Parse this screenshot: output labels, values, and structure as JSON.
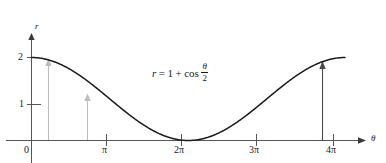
{
  "figure": {
    "kind": "math-plot",
    "equation": {
      "lhs": "r",
      "equals": "=",
      "term1": "1",
      "plus": "+",
      "func": "cos",
      "numerator": "θ",
      "denominator": "2",
      "full_text": "r = 1 + cos θ/2"
    },
    "axis_labels": {
      "y": "r",
      "x": "θ"
    },
    "colors": {
      "curve": "#1a1a1a",
      "axis": "#555555",
      "arrow_light": "#b8b8b8",
      "arrow_dark": "#4a4a4a",
      "background": "#ffffff"
    }
  },
  "chart_data": {
    "type": "line",
    "title": "",
    "subtitle": "",
    "xlabel": "θ",
    "ylabel": "r",
    "grid": false,
    "legend": null,
    "function": "r = 1 + cos(θ/2)",
    "xlim": [
      0,
      13.6
    ],
    "ylim": [
      0,
      2.35
    ],
    "x_ticks": [
      0,
      3.14159,
      6.28319,
      9.42478,
      12.56637
    ],
    "x_tick_labels": [
      "0",
      "π",
      "2π",
      "3π",
      "4π"
    ],
    "y_ticks": [
      1,
      2
    ],
    "y_tick_labels": [
      "1",
      "2"
    ],
    "x": [
      0,
      0.6283,
      1.2566,
      1.885,
      2.5133,
      3.1416,
      3.7699,
      4.3982,
      5.0265,
      5.6549,
      6.2832,
      6.9115,
      7.5398,
      8.1681,
      8.7965,
      9.4248,
      10.0531,
      10.6814,
      11.3097,
      11.9381,
      12.5664
    ],
    "y": [
      2.0,
      1.9511,
      1.809,
      1.5878,
      1.309,
      1.0,
      0.691,
      0.4122,
      0.191,
      0.0489,
      0.0,
      0.0489,
      0.191,
      0.4122,
      0.691,
      1.0,
      1.309,
      1.5878,
      1.809,
      1.9511,
      2.0
    ],
    "annotations": [
      {
        "label": "r = 1 + cos θ/2",
        "x": 5.2,
        "y": 1.58,
        "kind": "equation"
      }
    ],
    "arrows": [
      {
        "kind": "radius-arrow",
        "x": 0.63,
        "y_start": 0,
        "y_end": 1.95,
        "color": "#b8b8b8"
      },
      {
        "kind": "radius-arrow",
        "x": 2.05,
        "y_start": 0,
        "y_end": 1.44,
        "color": "#b8b8b8"
      },
      {
        "kind": "radius-arrow",
        "x": 11.85,
        "y_start": 0,
        "y_end": 1.94,
        "color": "#4a4a4a"
      }
    ]
  }
}
